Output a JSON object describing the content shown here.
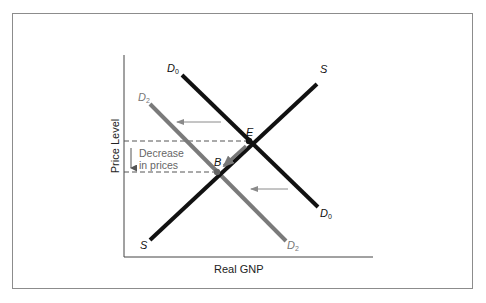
{
  "diagram": {
    "type": "aggregate-supply-demand",
    "axes": {
      "y_label": "Price Level",
      "x_label": "Real GNP"
    },
    "curves": [
      {
        "id": "D0",
        "label": "D",
        "subscript": "0",
        "color": "#111111",
        "role": "initial aggregate demand"
      },
      {
        "id": "D2",
        "label": "D",
        "subscript": "2",
        "color": "#7a7a7a",
        "role": "decreased aggregate demand"
      },
      {
        "id": "S",
        "label": "S",
        "subscript": "",
        "color": "#111111",
        "role": "aggregate supply"
      }
    ],
    "points": [
      {
        "id": "E",
        "label": "E"
      },
      {
        "id": "B",
        "label": "B"
      }
    ],
    "annotation": {
      "line1": "Decrease",
      "line2": "in prices"
    },
    "colors": {
      "frame": "#8c8c8c",
      "black_curve": "#111111",
      "gray_curve": "#7a7a7a",
      "arrow": "#8a8a8a",
      "dashed": "#555555"
    }
  }
}
